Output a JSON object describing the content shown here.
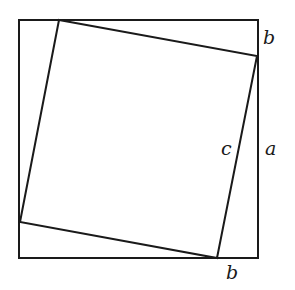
{
  "diagram": {
    "type": "pythagorean-proof-square-in-square",
    "outer_square": {
      "points": [
        [
          19,
          20
        ],
        [
          258,
          20
        ],
        [
          258,
          258
        ],
        [
          19,
          258
        ]
      ]
    },
    "inner_square": {
      "points": [
        [
          59,
          20
        ],
        [
          257,
          56
        ],
        [
          217,
          258
        ],
        [
          20,
          222
        ]
      ]
    },
    "labels": [
      {
        "id": "b-right",
        "text": "b",
        "x": 263,
        "y": 44
      },
      {
        "id": "c",
        "text": "c",
        "x": 221,
        "y": 155
      },
      {
        "id": "a",
        "text": "a",
        "x": 265,
        "y": 155
      },
      {
        "id": "b-bottom",
        "text": "b",
        "x": 226,
        "y": 279
      }
    ]
  }
}
